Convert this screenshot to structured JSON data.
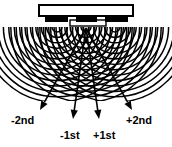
{
  "figure": {
    "width": 172,
    "height": 147,
    "background_color": "#ffffff",
    "ink_color": "#000000"
  },
  "grating": {
    "name": "interdigital transducer grating",
    "body": {
      "x": 39,
      "y": 5,
      "width": 94,
      "height": 11,
      "fill": "#ffffff",
      "stroke": "#000000"
    },
    "electrodes": [
      {
        "x": 45,
        "y": 16,
        "width": 23,
        "height": 6
      },
      {
        "x": 76,
        "y": 16,
        "width": 21,
        "height": 6
      },
      {
        "x": 105,
        "y": 16,
        "width": 23,
        "height": 6
      }
    ],
    "electrode_fill": "#000000",
    "base_plate": {
      "x": 70,
      "y": 20,
      "width": 36,
      "height": 6,
      "fill": "#ffffff",
      "stroke": "#000000"
    }
  },
  "wavefronts": {
    "name": "circular wavefront arcs",
    "sources": [
      {
        "cx": 57,
        "cy": 27
      },
      {
        "cx": 86,
        "cy": 27
      },
      {
        "cx": 115,
        "cy": 27
      }
    ],
    "arc_count": 14,
    "first_radius": 5,
    "radius_step": 5.4,
    "clip_bottom": 101,
    "stroke_color": "#000000",
    "stroke_width": 1.5
  },
  "beams": {
    "name": "diffraction order rays",
    "origin": {
      "x": 86,
      "y": 28
    },
    "rays": [
      {
        "id": "minus-2nd",
        "label": "-2nd",
        "tip_x": 40,
        "tip_y": 110,
        "label_x": 11,
        "label_y": 124,
        "angle_deg": -29
      },
      {
        "id": "minus-1st",
        "label": "-1st",
        "tip_x": 73,
        "tip_y": 119,
        "label_x": 60,
        "label_y": 139,
        "angle_deg": -8
      },
      {
        "id": "plus-1st",
        "label": "+1st",
        "tip_x": 99,
        "tip_y": 119,
        "label_x": 93,
        "label_y": 139,
        "angle_deg": 8
      },
      {
        "id": "plus-2nd",
        "label": "+2nd",
        "tip_x": 132,
        "tip_y": 110,
        "label_x": 126,
        "label_y": 124,
        "angle_deg": 29
      }
    ],
    "stroke_color": "#000000",
    "stroke_width": 1.6,
    "arrowhead_fill": "#000000"
  },
  "labels": {
    "minus_2nd": "-2nd",
    "minus_1st": "-1st",
    "plus_1st": "+1st",
    "plus_2nd": "+2nd"
  }
}
